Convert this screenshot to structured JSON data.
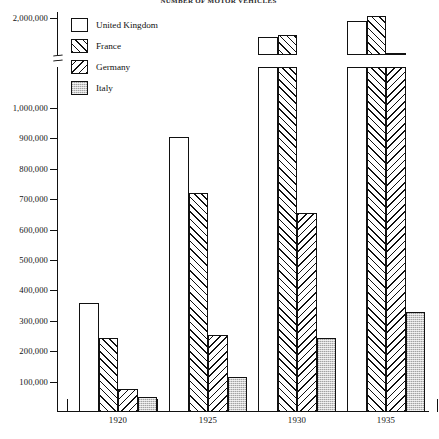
{
  "title": "NUMBER OF MOTOR VEHICLES",
  "chart_data": {
    "type": "bar",
    "title": "NUMBER OF MOTOR VEHICLES",
    "xlabel": "",
    "ylabel": "",
    "grid": false,
    "legend_position": "top-left",
    "axis_break": {
      "between": [
        1000000,
        2000000
      ],
      "symbol": "≈"
    },
    "ylim": [
      0,
      2000000
    ],
    "yticks": [
      {
        "value": 2000000,
        "label": "2,000,000"
      },
      {
        "value": 1000000,
        "label": "1,000,000"
      },
      {
        "value": 900000,
        "label": "900,000"
      },
      {
        "value": 800000,
        "label": "800,000"
      },
      {
        "value": 700000,
        "label": "700,000"
      },
      {
        "value": 600000,
        "label": "600,000"
      },
      {
        "value": 500000,
        "label": "500,000"
      },
      {
        "value": 400000,
        "label": "400,000"
      },
      {
        "value": 300000,
        "label": "300,000"
      },
      {
        "value": 200000,
        "label": "200,000"
      },
      {
        "value": 100000,
        "label": "100,000"
      }
    ],
    "categories": [
      "1920",
      "1925",
      "1930",
      "1935"
    ],
    "series": [
      {
        "name": "United Kingdom",
        "pattern": "solid-white",
        "values": [
          360000,
          905000,
          1480000,
          1930000
        ]
      },
      {
        "name": "France",
        "pattern": "diagonal-forward",
        "values": [
          245000,
          720000,
          1520000,
          2060000
        ]
      },
      {
        "name": "Germany",
        "pattern": "diagonal-back",
        "values": [
          75000,
          255000,
          655000,
          1020000
        ]
      },
      {
        "name": "Italy",
        "pattern": "gray-stipple",
        "values": [
          50000,
          115000,
          245000,
          330000
        ]
      }
    ]
  },
  "legend": {
    "items": [
      {
        "label": "United Kingdom",
        "swatch": "solid-white"
      },
      {
        "label": "France",
        "swatch": "diagonal-forward"
      },
      {
        "label": "Germany",
        "swatch": "diagonal-back"
      },
      {
        "label": "Italy",
        "swatch": "gray-stipple"
      }
    ]
  }
}
